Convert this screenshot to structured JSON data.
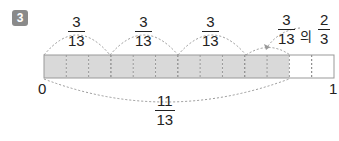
{
  "problem_number": "3",
  "colors": {
    "shaded": "#d9d9d9",
    "unshaded": "#ffffff",
    "border": "#999999",
    "arc": "#999999"
  },
  "bar": {
    "total_parts": 13,
    "shaded_parts": 11
  },
  "top_labels": [
    {
      "numerator": "3",
      "denominator": "13"
    },
    {
      "numerator": "3",
      "denominator": "13"
    },
    {
      "numerator": "3",
      "denominator": "13"
    }
  ],
  "last_label": {
    "numerator": "3",
    "denominator": "13",
    "particle": "의",
    "of_numerator": "2",
    "of_denominator": "3"
  },
  "axis": {
    "start": "0",
    "end": "1"
  },
  "bottom_label": {
    "numerator": "11",
    "denominator": "13"
  }
}
